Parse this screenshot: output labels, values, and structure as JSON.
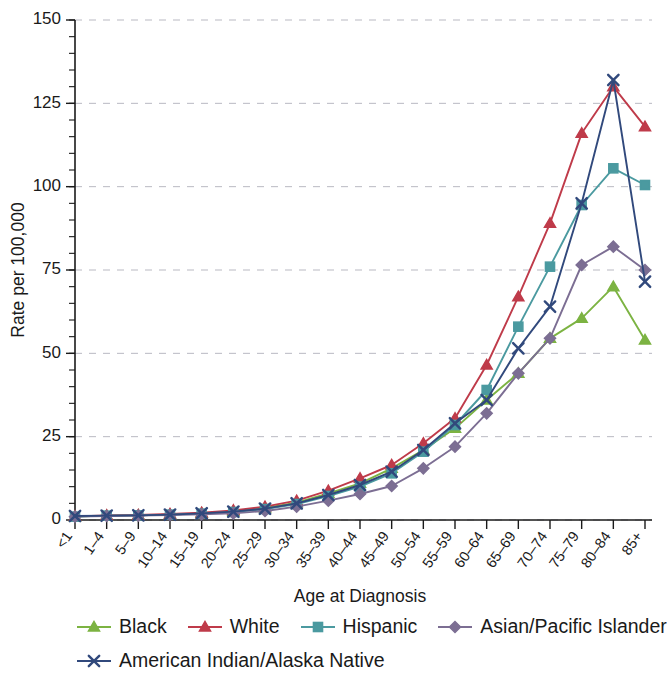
{
  "chart_data": {
    "type": "line",
    "title": "",
    "xlabel": "Age at Diagnosis",
    "ylabel": "Rate per 100,000",
    "ylim": [
      0,
      150
    ],
    "yticks": [
      0,
      25,
      50,
      75,
      100,
      125,
      150
    ],
    "ytick_labels": [
      "0",
      "25",
      "50",
      "75",
      "100",
      "125",
      "150"
    ],
    "y_minor_step": 5,
    "grid": "horizontal-dashed",
    "legend_position": "bottom",
    "categories": [
      "<1",
      "1–4",
      "5–9",
      "10–14",
      "15–19",
      "20–24",
      "25–29",
      "30–34",
      "35–39",
      "40–44",
      "45–49",
      "50–54",
      "55–59",
      "60–64",
      "65–69",
      "70–74",
      "75–79",
      "80–84",
      "85+"
    ],
    "series": [
      {
        "name": "Black",
        "color": "#7cb342",
        "marker": "triangle",
        "values": [
          1.0,
          1.3,
          1.4,
          1.6,
          2.0,
          2.6,
          3.6,
          5.2,
          8.0,
          11.0,
          15.5,
          21.0,
          27.5,
          36.0,
          44.0,
          54.5,
          60.5,
          70.0,
          54.0
        ]
      },
      {
        "name": "White",
        "color": "#bf3b4a",
        "marker": "triangle",
        "values": [
          1.1,
          1.4,
          1.5,
          1.8,
          2.2,
          2.9,
          4.0,
          5.8,
          8.8,
          12.5,
          16.5,
          23.0,
          30.5,
          46.5,
          67.0,
          89.0,
          116.0,
          130.0,
          118.0
        ]
      },
      {
        "name": "Hispanic",
        "color": "#4b9aa0",
        "marker": "square",
        "values": [
          1.0,
          1.3,
          1.4,
          1.6,
          1.9,
          2.4,
          3.3,
          4.8,
          7.2,
          10.0,
          14.0,
          20.5,
          28.5,
          39.0,
          58.0,
          76.0,
          94.5,
          105.5,
          100.5
        ]
      },
      {
        "name": "Asian/Pacific Islander",
        "color": "#7c6e93",
        "marker": "diamond",
        "values": [
          1.0,
          1.2,
          1.3,
          1.5,
          1.7,
          2.0,
          2.7,
          4.0,
          5.8,
          7.8,
          10.2,
          15.5,
          22.0,
          32.0,
          44.0,
          54.5,
          76.5,
          82.0,
          75.0
        ]
      },
      {
        "name": "American Indian/Alaska Native",
        "color": "#31497c",
        "marker": "x",
        "values": [
          1.2,
          1.3,
          1.4,
          1.6,
          2.0,
          2.5,
          3.4,
          5.0,
          7.5,
          10.5,
          14.5,
          21.0,
          29.0,
          36.0,
          51.5,
          64.0,
          95.0,
          132.0,
          71.5
        ]
      }
    ]
  }
}
